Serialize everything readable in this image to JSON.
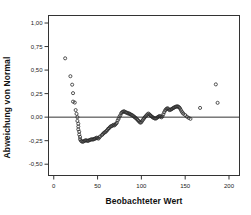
{
  "chart_data": {
    "type": "scatter",
    "title": "",
    "subtitle": "",
    "xlabel": "Beobachteter Wert",
    "ylabel": "Abweichung von Normal",
    "xlim": [
      -6,
      212
    ],
    "ylim": [
      -0.62,
      1.08
    ],
    "xticks": [
      0,
      50,
      100,
      150,
      200
    ],
    "xticklabels": [
      "0",
      "50",
      "100",
      "150",
      "200"
    ],
    "yticks": [
      -0.5,
      -0.25,
      0.0,
      0.25,
      0.5,
      0.75,
      1.0
    ],
    "yticklabels": [
      "-0,50",
      "-0,25",
      "0,00",
      "0,25",
      "0,50",
      "0,75",
      "1,00"
    ],
    "grid": false,
    "legend": null,
    "reference_line": {
      "orientation": "horizontal",
      "value": 0.0,
      "color": "#333333"
    },
    "marker": {
      "shape": "circle-open",
      "size": 3.1,
      "edge_color": "#2b2b2b",
      "fill": "none",
      "edge_width": 0.8
    },
    "frame_color": "#333333",
    "background": "#ffffff",
    "series": [
      {
        "name": "Abweichung von Normal",
        "points": [
          [
            13,
            0.625
          ],
          [
            19,
            0.435
          ],
          [
            21,
            0.345
          ],
          [
            22,
            0.255
          ],
          [
            22,
            0.165
          ],
          [
            24,
            0.155
          ],
          [
            25,
            0.075
          ],
          [
            26,
            0.035
          ],
          [
            27,
            0.0
          ],
          [
            27,
            -0.04
          ],
          [
            28,
            -0.07
          ],
          [
            28,
            -0.1
          ],
          [
            28,
            -0.13
          ],
          [
            29,
            -0.155
          ],
          [
            29,
            -0.185
          ],
          [
            30,
            -0.21
          ],
          [
            30,
            -0.235
          ],
          [
            31,
            -0.25
          ],
          [
            32,
            -0.258
          ],
          [
            33,
            -0.262
          ],
          [
            34,
            -0.258
          ],
          [
            35,
            -0.252
          ],
          [
            36,
            -0.248
          ],
          [
            37,
            -0.246
          ],
          [
            38,
            -0.25
          ],
          [
            39,
            -0.252
          ],
          [
            40,
            -0.248
          ],
          [
            41,
            -0.243
          ],
          [
            42,
            -0.24
          ],
          [
            43,
            -0.236
          ],
          [
            44,
            -0.236
          ],
          [
            45,
            -0.238
          ],
          [
            46,
            -0.232
          ],
          [
            47,
            -0.228
          ],
          [
            48,
            -0.225
          ],
          [
            49,
            -0.218
          ],
          [
            50,
            -0.222
          ],
          [
            51,
            -0.228
          ],
          [
            52,
            -0.215
          ],
          [
            53,
            -0.205
          ],
          [
            55,
            -0.19
          ],
          [
            56,
            -0.18
          ],
          [
            57,
            -0.17
          ],
          [
            58,
            -0.162
          ],
          [
            59,
            -0.158
          ],
          [
            60,
            -0.148
          ],
          [
            61,
            -0.138
          ],
          [
            62,
            -0.125
          ],
          [
            63,
            -0.118
          ],
          [
            64,
            -0.108
          ],
          [
            65,
            -0.098
          ],
          [
            66,
            -0.095
          ],
          [
            67,
            -0.09
          ],
          [
            68,
            -0.082
          ],
          [
            69,
            -0.088
          ],
          [
            70,
            -0.08
          ],
          [
            71,
            -0.07
          ],
          [
            72,
            -0.06
          ],
          [
            73,
            -0.035
          ],
          [
            74,
            -0.018
          ],
          [
            75,
            0.005
          ],
          [
            76,
            0.02
          ],
          [
            77,
            0.042
          ],
          [
            78,
            0.052
          ],
          [
            79,
            0.058
          ],
          [
            80,
            0.062
          ],
          [
            81,
            0.058
          ],
          [
            82,
            0.052
          ],
          [
            83,
            0.048
          ],
          [
            84,
            0.045
          ],
          [
            85,
            0.038
          ],
          [
            86,
            0.04
          ],
          [
            87,
            0.032
          ],
          [
            88,
            0.028
          ],
          [
            89,
            0.022
          ],
          [
            90,
            0.018
          ],
          [
            91,
            0.01
          ],
          [
            92,
            0.002
          ],
          [
            93,
            -0.005
          ],
          [
            94,
            -0.012
          ],
          [
            95,
            -0.022
          ],
          [
            96,
            -0.032
          ],
          [
            97,
            -0.042
          ],
          [
            98,
            -0.052
          ],
          [
            99,
            -0.06
          ],
          [
            100,
            -0.052
          ],
          [
            101,
            -0.038
          ],
          [
            102,
            -0.025
          ],
          [
            103,
            -0.012
          ],
          [
            104,
            0.0
          ],
          [
            105,
            0.01
          ],
          [
            106,
            0.02
          ],
          [
            107,
            0.03
          ],
          [
            108,
            0.038
          ],
          [
            109,
            0.03
          ],
          [
            110,
            0.022
          ],
          [
            111,
            0.012
          ],
          [
            112,
            0.005
          ],
          [
            113,
            -0.002
          ],
          [
            114,
            -0.008
          ],
          [
            115,
            -0.012
          ],
          [
            116,
            -0.016
          ],
          [
            117,
            -0.012
          ],
          [
            118,
            -0.005
          ],
          [
            119,
            0.002
          ],
          [
            120,
            0.008
          ],
          [
            121,
            0.012
          ],
          [
            122,
            0.005
          ],
          [
            123,
            -0.002
          ],
          [
            124,
            0.01
          ],
          [
            125,
            0.03
          ],
          [
            126,
            0.052
          ],
          [
            127,
            0.07
          ],
          [
            128,
            0.082
          ],
          [
            129,
            0.09
          ],
          [
            130,
            0.095
          ],
          [
            131,
            0.085
          ],
          [
            132,
            0.075
          ],
          [
            133,
            0.078
          ],
          [
            134,
            0.082
          ],
          [
            135,
            0.088
          ],
          [
            136,
            0.095
          ],
          [
            137,
            0.1
          ],
          [
            138,
            0.105
          ],
          [
            139,
            0.11
          ],
          [
            140,
            0.112
          ],
          [
            141,
            0.115
          ],
          [
            142,
            0.112
          ],
          [
            143,
            0.105
          ],
          [
            144,
            0.095
          ],
          [
            145,
            0.078
          ],
          [
            146,
            0.06
          ],
          [
            147,
            0.048
          ],
          [
            148,
            0.035
          ],
          [
            150,
            0.022
          ],
          [
            152,
            0.005
          ],
          [
            154,
            -0.008
          ],
          [
            156,
            -0.018
          ],
          [
            167,
            0.098
          ],
          [
            185,
            0.348
          ],
          [
            187,
            0.152
          ]
        ]
      }
    ]
  }
}
